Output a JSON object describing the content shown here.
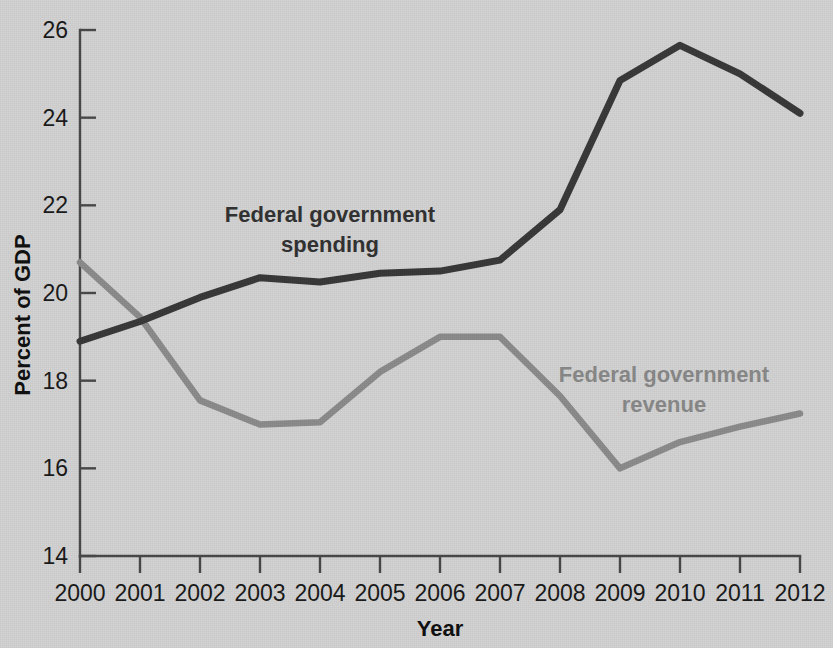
{
  "chart_data": {
    "type": "line",
    "title": "",
    "xlabel": "Year",
    "ylabel": "Percent of GDP",
    "x": [
      2000,
      2001,
      2002,
      2003,
      2004,
      2005,
      2006,
      2007,
      2008,
      2009,
      2010,
      2011,
      2012
    ],
    "categories": [
      "2000",
      "2001",
      "2002",
      "2003",
      "2004",
      "2005",
      "2006",
      "2007",
      "2008",
      "2009",
      "2010",
      "2011",
      "2012"
    ],
    "xlim": [
      2000,
      2012
    ],
    "ylim": [
      14,
      26
    ],
    "yticks": [
      14,
      16,
      18,
      20,
      22,
      24,
      26
    ],
    "ytick_labels": [
      "14",
      "16",
      "18",
      "20",
      "22",
      "24",
      "26"
    ],
    "grid": false,
    "legend_position": "inline-annotations",
    "series": [
      {
        "name": "Federal government spending",
        "color": "#3a3a3a",
        "values": [
          18.9,
          19.35,
          19.9,
          20.35,
          20.25,
          20.45,
          20.5,
          20.75,
          21.9,
          24.85,
          25.65,
          25.0,
          24.1
        ]
      },
      {
        "name": "Federal government revenue",
        "color": "#8d8d8d",
        "values": [
          20.7,
          19.45,
          17.55,
          17.0,
          17.05,
          18.2,
          19.0,
          19.0,
          17.65,
          16.0,
          16.6,
          16.95,
          17.25
        ]
      }
    ],
    "annotations": [
      {
        "name": "spending-label",
        "text_line1": "Federal government",
        "text_line2": "spending",
        "color": "#333333"
      },
      {
        "name": "revenue-label",
        "text_line1": "Federal government",
        "text_line2": "revenue",
        "color": "#8a8a8a"
      }
    ]
  },
  "axes": {
    "x_title": "Year",
    "y_title": "Percent of GDP"
  },
  "colors": {
    "background": "#d4d4d4",
    "axis": "#4a4a4a",
    "spending": "#3a3a3a",
    "revenue": "#8d8d8d",
    "text": "#1b1b1b"
  }
}
